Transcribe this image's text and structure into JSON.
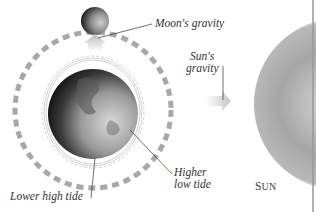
{
  "diagram": {
    "labels": {
      "moon_gravity": "Moon's gravity",
      "sun_gravity_line1": "Sun's",
      "sun_gravity_line2": "gravity",
      "higher_low_tide_line1": "Higher",
      "higher_low_tide_line2": "low tide",
      "lower_high_tide": "Lower high tide",
      "sun_first": "S",
      "sun_rest": "UN"
    },
    "colors": {
      "background": "#ffffff",
      "orbit_dash": "#a8a8a8",
      "arrow": "#c8c8c8",
      "sun": "#9a9a9a",
      "earth_dark": "#1a1a1a",
      "earth_light": "#c8c8c8",
      "leader_line": "#333333",
      "frame_line": "#999999"
    }
  }
}
